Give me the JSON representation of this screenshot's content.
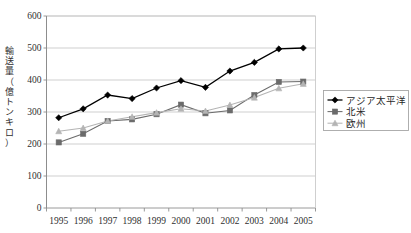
{
  "chart_data": {
    "type": "line",
    "title": "",
    "xlabel": "",
    "ylabel": "輸送量（億トンキロ）",
    "ylabel_chars": [
      "輸",
      "送",
      "量",
      "（",
      "億",
      "ト",
      "ン",
      "キ",
      "ロ",
      "）"
    ],
    "categories": [
      "1995",
      "1996",
      "1997",
      "1998",
      "1999",
      "2000",
      "2001",
      "2002",
      "2003",
      "2004",
      "2005"
    ],
    "yticks": [
      0,
      100,
      200,
      300,
      400,
      500,
      600
    ],
    "ylim": [
      0,
      600
    ],
    "grid": true,
    "legend_position": "right",
    "series": [
      {
        "name": "アジア太平洋",
        "color": "#000000",
        "marker": "diamond",
        "values": [
          282,
          310,
          353,
          342,
          375,
          398,
          377,
          428,
          455,
          497,
          500
        ]
      },
      {
        "name": "北米",
        "color": "#6b6b6b",
        "marker": "square",
        "values": [
          205,
          232,
          272,
          277,
          293,
          323,
          296,
          305,
          353,
          394,
          395
        ]
      },
      {
        "name": "欧州",
        "color": "#b4b4b4",
        "marker": "triangle",
        "values": [
          240,
          250,
          272,
          285,
          298,
          310,
          303,
          322,
          345,
          374,
          388
        ]
      }
    ]
  },
  "legend": {
    "items": [
      {
        "label": "アジア太平洋"
      },
      {
        "label": "北米"
      },
      {
        "label": "欧州"
      }
    ]
  },
  "axis": {
    "y_tick_labels": [
      "600",
      "500",
      "400",
      "300",
      "200",
      "100",
      "0"
    ],
    "x_tick_labels": [
      "1995",
      "1996",
      "1997",
      "1998",
      "1999",
      "2000",
      "2001",
      "2002",
      "2003",
      "2004",
      "2005"
    ]
  }
}
